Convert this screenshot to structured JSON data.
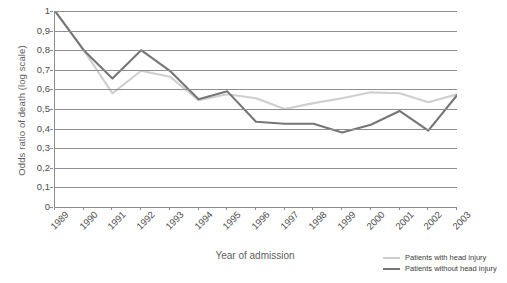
{
  "chart_data": {
    "type": "line",
    "title": "",
    "xlabel": "Year of admission",
    "ylabel": "Odds ratio of death (log scale)",
    "categories": [
      "1989",
      "1990",
      "1991",
      "1992",
      "1993",
      "1994",
      "1995",
      "1996",
      "1997",
      "1998",
      "1999",
      "2000",
      "2001",
      "2002",
      "2003"
    ],
    "ylim": [
      0,
      1
    ],
    "yticks": [
      "0",
      "0,1",
      "0,2",
      "0,3",
      "0,4",
      "0,5",
      "0,6",
      "0,7",
      "0,8",
      "0,9",
      "1"
    ],
    "ytick_values": [
      0,
      0.1,
      0.2,
      0.3,
      0.4,
      0.5,
      0.6,
      0.7,
      0.8,
      0.9,
      1
    ],
    "grid": true,
    "legend_position": "bottom-right",
    "series": [
      {
        "name": "Patients with head injury",
        "color": "#cfcfcf",
        "values": [
          1.0,
          0.8,
          0.58,
          0.695,
          0.665,
          0.545,
          0.575,
          0.555,
          0.5,
          0.53,
          0.555,
          0.585,
          0.58,
          0.535,
          0.575
        ]
      },
      {
        "name": "Patients without head injury",
        "color": "#767676",
        "values": [
          1.0,
          0.8,
          0.655,
          0.8,
          0.695,
          0.55,
          0.59,
          0.435,
          0.425,
          0.425,
          0.38,
          0.42,
          0.49,
          0.39,
          0.57
        ]
      }
    ]
  },
  "caption": {
    "text": ""
  }
}
